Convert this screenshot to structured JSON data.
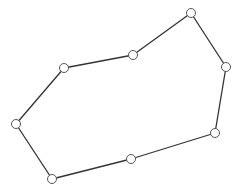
{
  "diagram": {
    "type": "polygon",
    "closed": true,
    "width": 236,
    "height": 192,
    "vertices": [
      {
        "id": "v1",
        "x": 191,
        "y": 13
      },
      {
        "id": "v2",
        "x": 226,
        "y": 67
      },
      {
        "id": "v3",
        "x": 215,
        "y": 133
      },
      {
        "id": "v4",
        "x": 131,
        "y": 159
      },
      {
        "id": "v5",
        "x": 52,
        "y": 179
      },
      {
        "id": "v6",
        "x": 16,
        "y": 124
      },
      {
        "id": "v7",
        "x": 64,
        "y": 68
      },
      {
        "id": "v8",
        "x": 133,
        "y": 55
      }
    ],
    "style": {
      "edge_color": "#333333",
      "edge_width": 1.3,
      "vertex_radius": 4.5,
      "vertex_fill": "#ffffff",
      "vertex_stroke": "#555555",
      "vertex_stroke_width": 1
    }
  }
}
